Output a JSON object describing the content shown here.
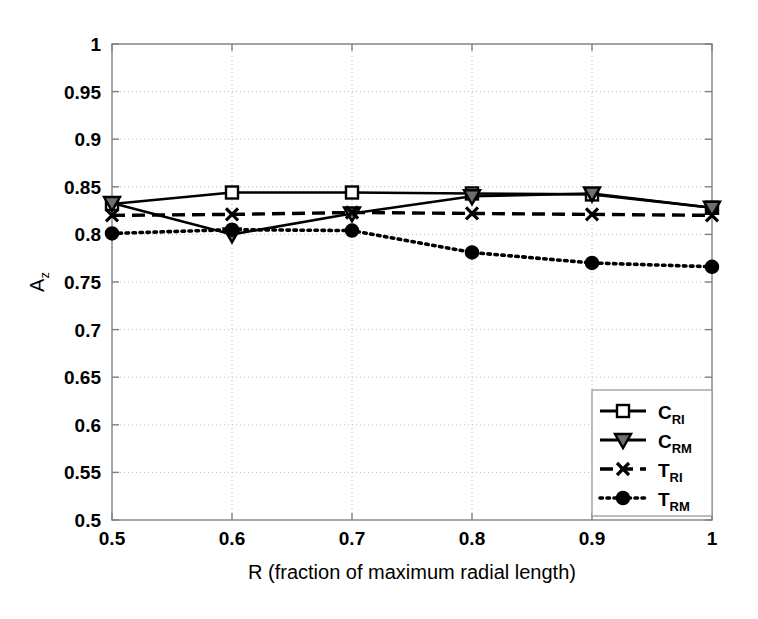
{
  "chart_data": {
    "type": "line",
    "title": "",
    "xlabel": "R (fraction of maximum radial length)",
    "ylabel": "A_z",
    "ylabel_base": "A",
    "ylabel_sub": "z",
    "x": [
      0.5,
      0.6,
      0.7,
      0.8,
      0.9,
      1.0
    ],
    "xlim": [
      0.5,
      1.0
    ],
    "ylim": [
      0.5,
      1.0
    ],
    "xticks": [
      "0.5",
      "0.6",
      "0.7",
      "0.8",
      "0.9",
      "1"
    ],
    "yticks": [
      "0.5",
      "0.55",
      "0.6",
      "0.65",
      "0.7",
      "0.75",
      "0.8",
      "0.85",
      "0.9",
      "0.95",
      "1"
    ],
    "grid": true,
    "grid_style": "dotted",
    "legend_position": "lower right",
    "series": [
      {
        "name": "C_RI",
        "label_base": "C",
        "label_sub": "RI",
        "marker": "square-open",
        "linestyle": "solid",
        "color": "#000000",
        "values": [
          0.832,
          0.844,
          0.844,
          0.843,
          0.842,
          0.828
        ]
      },
      {
        "name": "C_RM",
        "label_base": "C",
        "label_sub": "RM",
        "marker": "triangle-down-filled",
        "linestyle": "solid",
        "color": "#000000",
        "values": [
          0.833,
          0.8,
          0.822,
          0.84,
          0.843,
          0.828
        ]
      },
      {
        "name": "T_RI",
        "label_base": "T",
        "label_sub": "RI",
        "marker": "x",
        "linestyle": "dashed",
        "color": "#000000",
        "values": [
          0.82,
          0.821,
          0.823,
          0.822,
          0.821,
          0.82
        ]
      },
      {
        "name": "T_RM",
        "label_base": "T",
        "label_sub": "RM",
        "marker": "circle-filled",
        "linestyle": "dotted",
        "color": "#000000",
        "values": [
          0.801,
          0.805,
          0.804,
          0.781,
          0.77,
          0.766
        ]
      }
    ]
  }
}
